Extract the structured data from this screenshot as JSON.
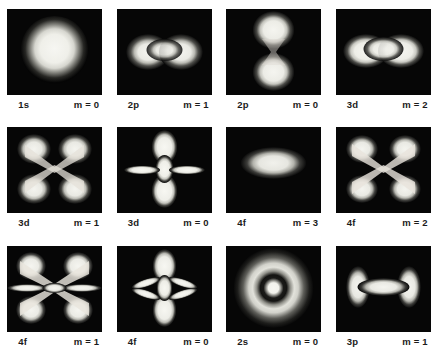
{
  "figure": {
    "kind": "photographic-plate",
    "background_color": "#ffffff",
    "panel_background_color": "#000000",
    "glow_color": "#f2f2ee",
    "rows": 3,
    "columns": 4
  },
  "panels": [
    {
      "id": "p1",
      "orbital": "1s",
      "m_label": "m = 0",
      "shape": "sphere",
      "row": 1,
      "col": 1
    },
    {
      "id": "p2",
      "orbital": "2p",
      "m_label": "m = 1",
      "shape": "torus-h",
      "row": 1,
      "col": 2
    },
    {
      "id": "p3",
      "orbital": "2p",
      "m_label": "m = 0",
      "shape": "dumbbell-v",
      "row": 1,
      "col": 3
    },
    {
      "id": "p4",
      "orbital": "3d",
      "m_label": "m = 2",
      "shape": "torus-wide",
      "row": 1,
      "col": 4
    },
    {
      "id": "p5",
      "orbital": "3d",
      "m_label": "m = 1",
      "shape": "cloverleaf",
      "row": 2,
      "col": 1
    },
    {
      "id": "p6",
      "orbital": "3d",
      "m_label": "m = 0",
      "shape": "dz2",
      "row": 2,
      "col": 2
    },
    {
      "id": "p7",
      "orbital": "4f",
      "m_label": "m = 3",
      "shape": "torus-flat",
      "row": 2,
      "col": 3
    },
    {
      "id": "p8",
      "orbital": "4f",
      "m_label": "m = 2",
      "shape": "cloverleaf-x",
      "row": 2,
      "col": 4
    },
    {
      "id": "p9",
      "orbital": "4f",
      "m_label": "m = 1",
      "shape": "six-lobe",
      "row": 3,
      "col": 1
    },
    {
      "id": "p10",
      "orbital": "4f",
      "m_label": "m = 0",
      "shape": "fz3",
      "row": 3,
      "col": 2
    },
    {
      "id": "p11",
      "orbital": "2s",
      "m_label": "m = 0",
      "shape": "core-ring",
      "row": 3,
      "col": 3
    },
    {
      "id": "p12",
      "orbital": "3p",
      "m_label": "m = 1",
      "shape": "barbell-h",
      "row": 3,
      "col": 4
    }
  ]
}
